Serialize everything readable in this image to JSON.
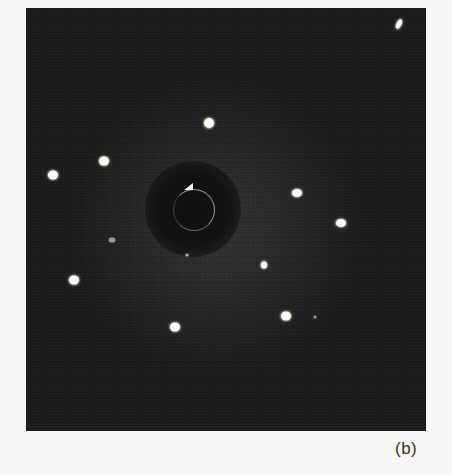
{
  "figure": {
    "panel_label": "(b)",
    "colors": {
      "page_background": "#f7f7f5",
      "panel_background": "#1c1c1c",
      "spot": "#fbfbf6",
      "label": "#333333"
    },
    "center": {
      "x": 193,
      "y": 209,
      "halo_radius": 48,
      "ring_radius": 20
    },
    "spots": [
      {
        "x": 399,
        "y": 24,
        "w": 5,
        "h": 10,
        "dim": false,
        "rot": 25
      },
      {
        "x": 209,
        "y": 123,
        "w": 10,
        "h": 10,
        "dim": false,
        "rot": 0
      },
      {
        "x": 104,
        "y": 161,
        "w": 10,
        "h": 9,
        "dim": false,
        "rot": 0
      },
      {
        "x": 53,
        "y": 175,
        "w": 10,
        "h": 9,
        "dim": false,
        "rot": 0
      },
      {
        "x": 297,
        "y": 193,
        "w": 10,
        "h": 8,
        "dim": false,
        "rot": 0
      },
      {
        "x": 341,
        "y": 223,
        "w": 10,
        "h": 8,
        "dim": false,
        "rot": 0
      },
      {
        "x": 112,
        "y": 240,
        "w": 7,
        "h": 5,
        "dim": true,
        "rot": 0
      },
      {
        "x": 187,
        "y": 255,
        "w": 4,
        "h": 3,
        "dim": true,
        "rot": 0
      },
      {
        "x": 264,
        "y": 265,
        "w": 6,
        "h": 7,
        "dim": false,
        "rot": 0
      },
      {
        "x": 74,
        "y": 280,
        "w": 10,
        "h": 9,
        "dim": false,
        "rot": 0
      },
      {
        "x": 286,
        "y": 316,
        "w": 10,
        "h": 9,
        "dim": false,
        "rot": 0
      },
      {
        "x": 175,
        "y": 327,
        "w": 10,
        "h": 9,
        "dim": false,
        "rot": 0
      },
      {
        "x": 315,
        "y": 317,
        "w": 3,
        "h": 3,
        "dim": true,
        "rot": 0
      }
    ]
  }
}
